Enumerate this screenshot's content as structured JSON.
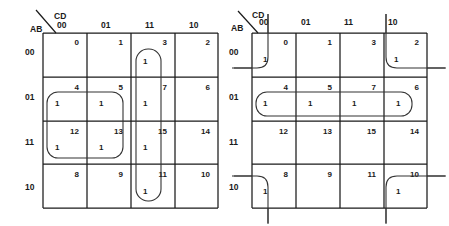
{
  "figure": {
    "type": "karnaugh-map-pair",
    "background": "#ffffff",
    "line_color": "#1a1a1a",
    "group_color": "#333333"
  },
  "maps": [
    {
      "id": "left",
      "row_var": "AB",
      "col_var": "CD",
      "col_headers": [
        "00",
        "01",
        "11",
        "10"
      ],
      "row_headers": [
        "00",
        "01",
        "11",
        "10"
      ],
      "cells": [
        [
          {
            "num": "0",
            "val": ""
          },
          {
            "num": "1",
            "val": ""
          },
          {
            "num": "3",
            "val": "1"
          },
          {
            "num": "2",
            "val": ""
          }
        ],
        [
          {
            "num": "4",
            "val": "1"
          },
          {
            "num": "5",
            "val": "1"
          },
          {
            "num": "7",
            "val": "1"
          },
          {
            "num": "6",
            "val": ""
          }
        ],
        [
          {
            "num": "12",
            "val": "1"
          },
          {
            "num": "13",
            "val": "1"
          },
          {
            "num": "15",
            "val": "1"
          },
          {
            "num": "14",
            "val": ""
          }
        ],
        [
          {
            "num": "8",
            "val": ""
          },
          {
            "num": "9",
            "val": ""
          },
          {
            "num": "11",
            "val": "1"
          },
          {
            "num": "10",
            "val": ""
          }
        ]
      ],
      "groups": [
        {
          "name": "group-square-4-5-12-13",
          "shape": "rounded-rect",
          "cells": [
            "4",
            "5",
            "12",
            "13"
          ]
        },
        {
          "name": "group-column-3-7-15-11",
          "shape": "rounded-rect",
          "cells": [
            "3",
            "7",
            "15",
            "11"
          ]
        }
      ]
    },
    {
      "id": "right",
      "row_var": "AB",
      "col_var": "CD",
      "col_headers": [
        "00",
        "01",
        "11",
        "10"
      ],
      "row_headers": [
        "00",
        "01",
        "11",
        "10"
      ],
      "cells": [
        [
          {
            "num": "0",
            "val": "1"
          },
          {
            "num": "1",
            "val": ""
          },
          {
            "num": "3",
            "val": ""
          },
          {
            "num": "2",
            "val": "1"
          }
        ],
        [
          {
            "num": "4",
            "val": "1"
          },
          {
            "num": "5",
            "val": "1"
          },
          {
            "num": "7",
            "val": "1"
          },
          {
            "num": "6",
            "val": "1"
          }
        ],
        [
          {
            "num": "12",
            "val": ""
          },
          {
            "num": "13",
            "val": ""
          },
          {
            "num": "15",
            "val": ""
          },
          {
            "num": "14",
            "val": ""
          }
        ],
        [
          {
            "num": "8",
            "val": "1"
          },
          {
            "num": "9",
            "val": ""
          },
          {
            "num": "11",
            "val": ""
          },
          {
            "num": "10",
            "val": "1"
          }
        ]
      ],
      "groups": [
        {
          "name": "group-corner-0",
          "shape": "corner-wrap",
          "cells": [
            "0"
          ]
        },
        {
          "name": "group-corner-2",
          "shape": "corner-wrap",
          "cells": [
            "2"
          ]
        },
        {
          "name": "group-corner-8",
          "shape": "corner-wrap",
          "cells": [
            "8"
          ]
        },
        {
          "name": "group-corner-10",
          "shape": "corner-wrap",
          "cells": [
            "10"
          ]
        },
        {
          "name": "group-row-4-5-7-6",
          "shape": "rounded-rect",
          "cells": [
            "4",
            "5",
            "7",
            "6"
          ]
        }
      ]
    }
  ]
}
